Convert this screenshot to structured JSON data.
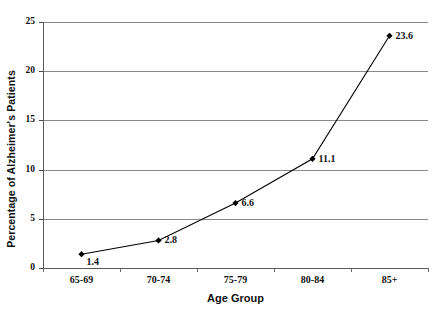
{
  "chart_data": {
    "type": "line",
    "title": "",
    "xlabel": "Age Group",
    "ylabel": "Percentage of Alzheimer's Patients",
    "categories": [
      "65-69",
      "70-74",
      "75-79",
      "80-84",
      "85+"
    ],
    "values": [
      1.4,
      2.8,
      6.6,
      11.1,
      23.6
    ],
    "point_labels": [
      "1.4",
      "2.8",
      "6.6",
      "11.1",
      "23.6"
    ],
    "ylim": [
      0,
      25
    ],
    "yticks": [
      0,
      5,
      10,
      15,
      20,
      25
    ],
    "ytick_labels": [
      "0",
      "5",
      "10",
      "15",
      "20",
      "25"
    ],
    "grid": true,
    "grid_axis": "y",
    "legend": false,
    "legend_position": "none",
    "marker": "diamond",
    "series_color": "#000000",
    "grid_color": "#8a8a8a",
    "axis_color": "#5a5a5a",
    "background_color": "#ffffff"
  }
}
